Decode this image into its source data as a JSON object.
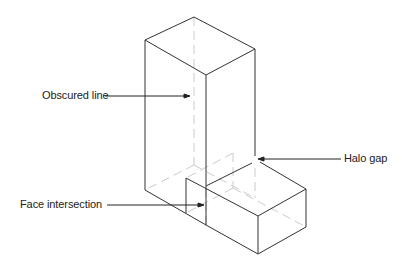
{
  "diagram": {
    "type": "isometric-hidden-line-illustration",
    "labels": [
      {
        "id": "obscured",
        "text": "Obscured line"
      },
      {
        "id": "halo",
        "text": "Halo gap"
      },
      {
        "id": "face",
        "text": "Face intersection"
      }
    ],
    "colors": {
      "solid": "#333333",
      "hidden": "#cfcfcf",
      "text": "#222222"
    }
  }
}
